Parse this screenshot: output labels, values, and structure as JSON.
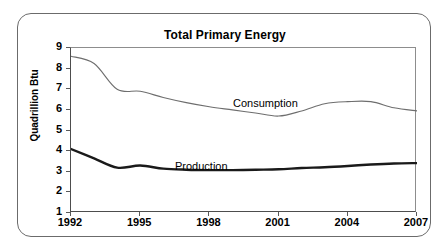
{
  "chart_data": {
    "type": "line",
    "title": "Total Primary Energy",
    "xlabel": "",
    "ylabel": "Quadrillion Btu",
    "xlim": [
      1992,
      2007
    ],
    "ylim": [
      1,
      9
    ],
    "ytick_labels": [
      "9",
      "8",
      "7",
      "6",
      "5",
      "4",
      "3",
      "2",
      "1"
    ],
    "ytick_values": [
      9,
      8,
      7,
      6,
      5,
      4,
      3,
      2,
      1
    ],
    "xtick_labels": [
      "1992",
      "1995",
      "1998",
      "2001",
      "2004",
      "2007"
    ],
    "xtick_values": [
      1992,
      1995,
      1998,
      2001,
      2004,
      2007
    ],
    "grid": false,
    "legend_position": "inline-annotations",
    "x": [
      1992,
      1993,
      1994,
      1995,
      1996,
      1997,
      1998,
      1999,
      2000,
      2001,
      2002,
      2003,
      2004,
      2005,
      2006,
      2007
    ],
    "series": [
      {
        "name": "Consumption",
        "color": "#6e6e6e",
        "line_width": 1.1,
        "values": [
          8.6,
          8.25,
          7.0,
          6.9,
          6.6,
          6.35,
          6.15,
          6.0,
          5.85,
          5.7,
          5.95,
          6.3,
          6.4,
          6.4,
          6.1,
          5.95
        ]
      },
      {
        "name": "Production",
        "color": "#1a1a1a",
        "line_width": 2.4,
        "values": [
          4.1,
          3.65,
          3.2,
          3.3,
          3.15,
          3.1,
          3.08,
          3.08,
          3.1,
          3.12,
          3.18,
          3.22,
          3.28,
          3.35,
          3.4,
          3.42
        ]
      }
    ],
    "annotations": [
      {
        "text": "Consumption",
        "series": "Consumption"
      },
      {
        "text": "Production",
        "series": "Production"
      }
    ]
  },
  "frame": {
    "border_color": "#6b6b6b",
    "background": "#ffffff"
  }
}
